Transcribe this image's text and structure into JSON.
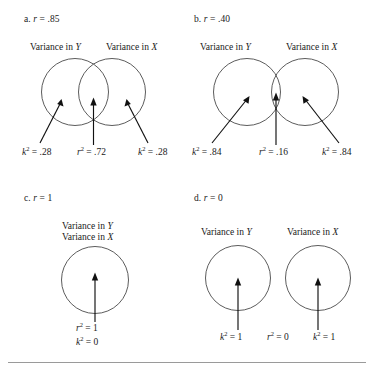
{
  "figure": {
    "type": "venn-diagram-set",
    "caption_rule": true,
    "panels": [
      {
        "id": "a",
        "label_prefix": "a.",
        "label_var": "r",
        "label_eq": "= .85",
        "variance_y_title": "Variance in",
        "variance_y_var": "Y",
        "variance_x_title": "Variance in",
        "variance_x_var": "X",
        "circles": 2,
        "overlap": "high",
        "values": [
          {
            "sym": "k",
            "exp": "2",
            "eq": "= .28"
          },
          {
            "sym": "r",
            "exp": "2",
            "eq": "= .72"
          },
          {
            "sym": "k",
            "exp": "2",
            "eq": "= .28"
          }
        ]
      },
      {
        "id": "b",
        "label_prefix": "b.",
        "label_var": "r",
        "label_eq": "= .40",
        "variance_y_title": "Variance in",
        "variance_y_var": "Y",
        "variance_x_title": "Variance in",
        "variance_x_var": "X",
        "circles": 2,
        "overlap": "low",
        "values": [
          {
            "sym": "k",
            "exp": "2",
            "eq": "= .84"
          },
          {
            "sym": "r",
            "exp": "2",
            "eq": "= .16"
          },
          {
            "sym": "k",
            "exp": "2",
            "eq": "= .84"
          }
        ]
      },
      {
        "id": "c",
        "label_prefix": "c.",
        "label_var": "r",
        "label_eq": "= 1",
        "variance_y_title": "Variance in",
        "variance_y_var": "Y",
        "variance_x_title": "Variance in",
        "variance_x_var": "X",
        "circles": 1,
        "overlap": "complete",
        "values": [
          {
            "sym": "r",
            "exp": "2",
            "eq": "= 1"
          },
          {
            "sym": "k",
            "exp": "2",
            "eq": "= 0"
          }
        ]
      },
      {
        "id": "d",
        "label_prefix": "d.",
        "label_var": "r",
        "label_eq": "= 0",
        "variance_y_title": "Variance in",
        "variance_y_var": "Y",
        "variance_x_title": "Variance in",
        "variance_x_var": "X",
        "circles": 2,
        "overlap": "none",
        "values": [
          {
            "sym": "k",
            "exp": "2",
            "eq": "= 1"
          },
          {
            "sym": "r",
            "exp": "2",
            "eq": "= 0"
          },
          {
            "sym": "k",
            "exp": "2",
            "eq": "= 1"
          }
        ]
      }
    ],
    "colors": {
      "circle_stroke": "#4a4a4a",
      "arrow": "#111111",
      "text": "#1a1a1a",
      "rule": "#9a9a9a",
      "background": "#ffffff"
    }
  }
}
